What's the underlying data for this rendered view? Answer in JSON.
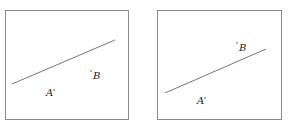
{
  "panels": [
    {
      "box": {
        "x": 5,
        "y": 10,
        "w": 123,
        "h": 109
      },
      "line": {
        "x1": 12,
        "y1": 84,
        "x2": 115,
        "y2": 40
      },
      "points": [
        {
          "label": "A",
          "label_x": 46,
          "label_y": 96,
          "dot_x": 54,
          "dot_y": 90
        },
        {
          "label": "B",
          "label_x": 93,
          "label_y": 79,
          "dot_x": 91,
          "dot_y": 71
        }
      ]
    },
    {
      "box": {
        "x": 157,
        "y": 10,
        "w": 124,
        "h": 109
      },
      "line": {
        "x1": 165,
        "y1": 93,
        "x2": 266,
        "y2": 49
      },
      "points": [
        {
          "label": "A",
          "label_x": 197,
          "label_y": 104,
          "dot_x": 205,
          "dot_y": 98
        },
        {
          "label": "B",
          "label_x": 239,
          "label_y": 51,
          "dot_x": 237,
          "dot_y": 43
        }
      ]
    }
  ],
  "colors": {
    "box": "#8a8a8a",
    "line": "#777777",
    "text": "#222222"
  }
}
